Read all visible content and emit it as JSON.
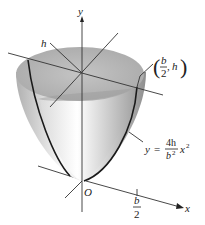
{
  "figure": {
    "labels": {
      "y_axis": "y",
      "x_axis": "x",
      "height": "h",
      "origin": "O",
      "point": {
        "open": "(",
        "frac_num": "b",
        "frac_den": "2",
        "sep": ",",
        "h": "h",
        "close": ")"
      },
      "equation": {
        "lhs": "y",
        "eq": "=",
        "frac_num": "4h",
        "frac_den": "b",
        "den_exp": "2",
        "var": "x",
        "var_exp": "2"
      },
      "x_tick": {
        "frac_num": "b",
        "frac_den": "2"
      }
    },
    "colors": {
      "surface_light": "#f4f4f4",
      "surface_dark": "#9a9a9a",
      "top_cap": "#b8b8b8",
      "line": "#1a1a1a"
    }
  }
}
